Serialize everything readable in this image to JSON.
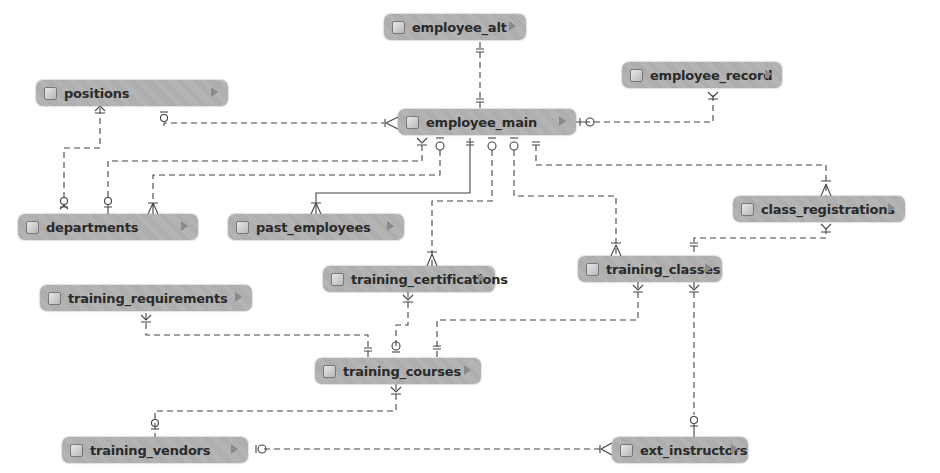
{
  "diagram": {
    "type": "entity-relationship",
    "entities": [
      {
        "id": "employee_alt",
        "label": "employee_alt",
        "x": 384,
        "y": 14,
        "w": 142
      },
      {
        "id": "positions",
        "label": "positions",
        "x": 36,
        "y": 80,
        "w": 192
      },
      {
        "id": "employee_record",
        "label": "employee_record",
        "x": 622,
        "y": 62,
        "w": 160
      },
      {
        "id": "employee_main",
        "label": "employee_main",
        "x": 398,
        "y": 109,
        "w": 178
      },
      {
        "id": "departments",
        "label": "departments",
        "x": 18,
        "y": 214,
        "w": 180
      },
      {
        "id": "past_employees",
        "label": "past_employees",
        "x": 228,
        "y": 214,
        "w": 176
      },
      {
        "id": "class_registrations",
        "label": "class_registrations",
        "x": 733,
        "y": 196,
        "w": 172
      },
      {
        "id": "training_certifications",
        "label": "training_certifications",
        "x": 323,
        "y": 266,
        "w": 172
      },
      {
        "id": "training_classes",
        "label": "training_classes",
        "x": 578,
        "y": 256,
        "w": 144
      },
      {
        "id": "training_requirements",
        "label": "training_requirements",
        "x": 40,
        "y": 285,
        "w": 212
      },
      {
        "id": "training_courses",
        "label": "training_courses",
        "x": 315,
        "y": 358,
        "w": 166
      },
      {
        "id": "training_vendors",
        "label": "training_vendors",
        "x": 62,
        "y": 437,
        "w": 186
      },
      {
        "id": "ext_instructors",
        "label": "ext_instructors",
        "x": 612,
        "y": 437,
        "w": 136
      }
    ],
    "relationships": [
      {
        "from": "employee_alt",
        "to": "employee_main",
        "from_end": "one-only",
        "to_end": "one-only",
        "style": "dashed"
      },
      {
        "from": "positions",
        "to": "departments",
        "from_end": "one-or-many",
        "to_end": "zero-or-one",
        "style": "dashed"
      },
      {
        "from": "positions",
        "to": "employee_main",
        "from_end": "zero-or-one",
        "to_end": "one-or-many",
        "style": "dashed"
      },
      {
        "from": "employee_record",
        "to": "employee_main",
        "from_end": "one-or-many",
        "to_end": "zero-or-one",
        "style": "dashed"
      },
      {
        "from": "employee_main",
        "to": "departments",
        "from_end": "one-or-many",
        "to_end": "zero-or-one",
        "style": "dashed"
      },
      {
        "from": "employee_main",
        "to": "departments",
        "from_end": "zero-or-one",
        "to_end": "one-or-many",
        "style": "dashed"
      },
      {
        "from": "employee_main",
        "to": "past_employees",
        "from_end": "one-only",
        "to_end": "one-or-many",
        "style": "solid"
      },
      {
        "from": "employee_main",
        "to": "training_certifications",
        "from_end": "zero-or-one",
        "to_end": "one-or-many",
        "style": "dashed"
      },
      {
        "from": "employee_main",
        "to": "training_classes",
        "from_end": "zero-or-one",
        "to_end": "one-or-many",
        "style": "dashed"
      },
      {
        "from": "employee_main",
        "to": "class_registrations",
        "from_end": "one-only",
        "to_end": "one-or-many",
        "style": "dashed"
      },
      {
        "from": "class_registrations",
        "to": "training_classes",
        "from_end": "one-or-many",
        "to_end": "one-only",
        "style": "dashed"
      },
      {
        "from": "training_certifications",
        "to": "training_courses",
        "from_end": "one-or-many",
        "to_end": "zero-or-one",
        "style": "dashed"
      },
      {
        "from": "training_requirements",
        "to": "training_courses",
        "from_end": "one-or-many",
        "to_end": "one-only",
        "style": "dashed"
      },
      {
        "from": "training_classes",
        "to": "training_courses",
        "from_end": "one-or-many",
        "to_end": "one-only",
        "style": "dashed"
      },
      {
        "from": "training_courses",
        "to": "training_vendors",
        "from_end": "one-or-many",
        "to_end": "zero-or-one",
        "style": "dashed"
      },
      {
        "from": "training_classes",
        "to": "ext_instructors",
        "from_end": "one-or-many",
        "to_end": "zero-or-one",
        "style": "dashed"
      },
      {
        "from": "training_vendors",
        "to": "ext_instructors",
        "from_end": "zero-or-one",
        "to_end": "one-or-many",
        "style": "dashed"
      }
    ],
    "colors": {
      "entity_fill": "#b1b1b1",
      "line": "#444444",
      "text": "#2a2a2a"
    }
  }
}
